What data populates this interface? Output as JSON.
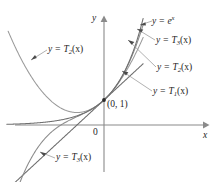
{
  "figure": {
    "background_color": "#ffffff",
    "axis_color": "#8a8a8a",
    "text_color": "#1d1d1d"
  },
  "axes": {
    "x_label": "x",
    "y_label": "y",
    "origin_label": "0"
  },
  "annotations": {
    "point_label": "(0, 1)"
  },
  "curve_labels": {
    "exp": {
      "lhs": "y = ",
      "fn": "e",
      "exponent": "x"
    },
    "t3_right": {
      "lhs": "y = ",
      "fn": "T",
      "sub": "3",
      "arg": "(x)"
    },
    "t2_right": {
      "lhs": "y = ",
      "fn": "T",
      "sub": "2",
      "arg": "(x)"
    },
    "t1_right": {
      "lhs": "y = ",
      "fn": "T",
      "sub": "1",
      "arg": "(x)"
    },
    "t2_left": {
      "lhs": "y = ",
      "fn": "T",
      "sub": "2",
      "arg": "(x)"
    },
    "t3_bottom": {
      "lhs": "y = ",
      "fn": "T",
      "sub": "3",
      "arg": "(x)"
    }
  },
  "chart_data": {
    "type": "line",
    "title": "",
    "xlabel": "x",
    "ylabel": "y",
    "xlim": [
      -3.6,
      2.0
    ],
    "ylim": [
      -2.4,
      5.0
    ],
    "grid": false,
    "legend": "inline-leader-labels",
    "annotation_points": [
      {
        "label": "(0, 1)",
        "x": 0,
        "y": 1
      }
    ],
    "series": [
      {
        "name": "y = e^x",
        "expression": "exp(x)",
        "color": "#6f6f6f",
        "x_range": [
          -3.6,
          1.45
        ],
        "label_text": "y = e^x"
      },
      {
        "name": "y = T3(x)",
        "expression": "1 + x + x^2/2 + x^3/6",
        "color": "#8b8b8b",
        "x_range": [
          -3.3,
          1.45
        ],
        "label_text": "y = T3(x)"
      },
      {
        "name": "y = T2(x)",
        "expression": "1 + x + x^2/2",
        "color": "#9a9a9a",
        "x_range": [
          -3.55,
          1.45
        ],
        "label_text": "y = T2(x)"
      },
      {
        "name": "y = T1(x)",
        "expression": "1 + x",
        "color": "#6b6b6b",
        "x_range": [
          -3.3,
          1.45
        ],
        "label_text": "y = T1(x)"
      }
    ]
  }
}
